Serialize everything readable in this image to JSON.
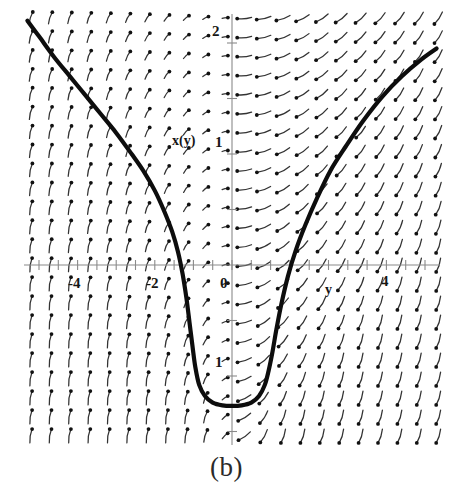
{
  "figure": {
    "caption": "(b)",
    "curve_label": "x(y)",
    "horizontal_axis_label": "y",
    "x_tick_labels": [
      "-4",
      "-2",
      "0",
      "4"
    ],
    "y_tick_labels": [
      "2",
      "1",
      "1"
    ]
  },
  "chart_data": {
    "type": "line",
    "title": "",
    "subtitle": "",
    "xlabel": "y",
    "ylabel": "x(y)",
    "xlim": [
      -5.3,
      5.3
    ],
    "ylim": [
      -1.6,
      2.2
    ],
    "grid": false,
    "legend_position": "none",
    "axis_style": "centered-cross",
    "x_ticks": [
      -5,
      -4.5,
      -4,
      -3.5,
      -3,
      -2.5,
      -2,
      -1.5,
      -1,
      -0.5,
      0,
      0.5,
      1,
      1.5,
      2,
      2.5,
      3,
      3.5,
      4,
      4.5,
      5
    ],
    "x_tick_labels_shown": {
      "-4": "-4",
      "-2": "-2",
      "0": "0",
      "4": "4"
    },
    "y_ticks": [
      -1.5,
      -1,
      -0.5,
      0,
      0.5,
      1,
      1.5,
      2
    ],
    "y_tick_labels_shown": {
      "2": "2",
      "1": "1",
      "-1": "1"
    },
    "annotations": [
      {
        "text": "x(y)",
        "x": -1.5,
        "y": 1.1
      },
      {
        "text": "y",
        "x": 2.55,
        "y": -0.2
      },
      {
        "text": "(b)",
        "x": 0,
        "y": -2.0,
        "role": "figure-caption"
      }
    ],
    "series": [
      {
        "name": "x(y)",
        "style": "thick-solid",
        "color": "#0d0d0d",
        "description": "Solution curve: steep-walled U / catenary-like trough with minimum near (0, -1.2) and asymptotically linear branches of slope about -0.45 on the left and +0.45 on the right.",
        "x": [
          -5.3,
          -5.0,
          -4.6,
          -4.2,
          -3.8,
          -3.4,
          -3.0,
          -2.6,
          -2.3,
          -2.0,
          -1.75,
          -1.55,
          -1.4,
          -1.28,
          -1.18,
          -1.1,
          -1.02,
          -0.95,
          -0.85,
          -0.7,
          -0.5,
          -0.25,
          0.0,
          0.25,
          0.5,
          0.7,
          0.85,
          0.95,
          1.05,
          1.15,
          1.28,
          1.45,
          1.65,
          1.9,
          2.2,
          2.55,
          2.95,
          3.4,
          3.9,
          4.4,
          4.9,
          5.3
        ],
        "y": [
          2.2,
          2.06,
          1.87,
          1.7,
          1.53,
          1.36,
          1.19,
          1.0,
          0.85,
          0.67,
          0.48,
          0.3,
          0.12,
          -0.08,
          -0.3,
          -0.52,
          -0.74,
          -0.92,
          -1.08,
          -1.18,
          -1.24,
          -1.265,
          -1.27,
          -1.265,
          -1.24,
          -1.18,
          -1.08,
          -0.95,
          -0.78,
          -0.58,
          -0.35,
          -0.1,
          0.13,
          0.36,
          0.6,
          0.85,
          1.07,
          1.3,
          1.52,
          1.7,
          1.85,
          1.95
        ]
      },
      {
        "name": "direction-field",
        "style": "arrow-grid",
        "color": "#333333",
        "description": "Slope/direction field of short tapered arrows on a regular grid; arrows carry a round dot at the tail and taper toward the head. Field rotates from near-vertical-down on the far left, through horizontal near the top center, to near-vertical-up on the far right, forming a saddle/trough pattern around the solution curve.",
        "grid_spacing_x": 0.5,
        "grid_spacing_y": 0.17
      }
    ]
  }
}
